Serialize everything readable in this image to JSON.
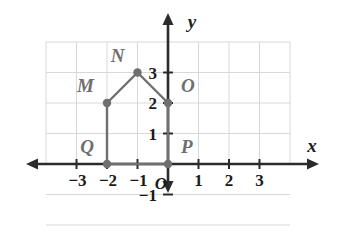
{
  "figure": {
    "kind": "coordinate-plane-polygon",
    "background_color": "#ffffff",
    "grid_color": "#d8d8d8",
    "axis_color": "#2b2b2b",
    "shape_color": "#6f6f6f",
    "axis_labels": {
      "x": "x",
      "y": "y"
    },
    "origin_label": "O"
  },
  "chart_data": {
    "type": "scatter",
    "title": "",
    "xlabel": "x",
    "ylabel": "y",
    "xlim": [
      -4,
      4
    ],
    "ylim": [
      -2,
      4
    ],
    "grid": true,
    "legend": "none",
    "x_ticks": [
      -3,
      -2,
      -1,
      1,
      2,
      3
    ],
    "x_tick_labels": [
      "−3",
      "−2",
      "−1",
      "1",
      "2",
      "3"
    ],
    "y_ticks": [
      -1,
      1,
      2,
      3
    ],
    "y_tick_labels": [
      "−1",
      "1",
      "2",
      "3"
    ],
    "points": [
      {
        "label": "M",
        "x": -2,
        "y": 2,
        "label_pos": "upper-left"
      },
      {
        "label": "N",
        "x": -1,
        "y": 3,
        "label_pos": "upper-left"
      },
      {
        "label": "O",
        "x": 0,
        "y": 2,
        "label_pos": "upper-right"
      },
      {
        "label": "P",
        "x": 0,
        "y": 0,
        "label_pos": "upper-right"
      },
      {
        "label": "Q",
        "x": -2,
        "y": 0,
        "label_pos": "upper-left"
      }
    ],
    "polygon_order": [
      "M",
      "N",
      "O",
      "P",
      "Q"
    ],
    "polygon_closed": true
  }
}
